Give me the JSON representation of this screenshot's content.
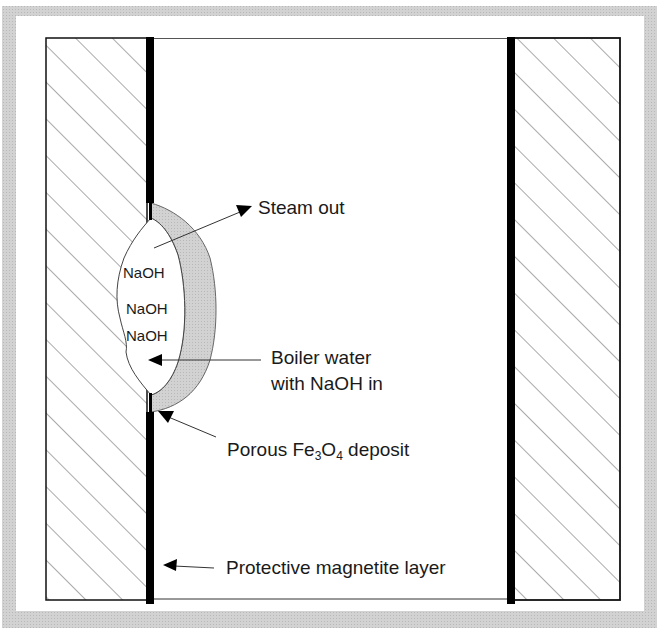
{
  "diagram": {
    "frame_color": "#c8c8c8",
    "deposit_color": "#cfcfcf",
    "layer_color": "#000000",
    "labels": {
      "steam_out": "Steam out",
      "boiler_water_line1": "Boiler water",
      "boiler_water_line2": "with NaOH in",
      "porous_deposit_prefix": "Porous Fe",
      "porous_deposit_sub1": "3",
      "porous_deposit_mid": "O",
      "porous_deposit_sub2": "4",
      "porous_deposit_suffix": " deposit",
      "protective_layer": "Protective magnetite layer",
      "naoh_1": "NaOH",
      "naoh_2": "NaOH",
      "naoh_3": "NaOH"
    }
  }
}
